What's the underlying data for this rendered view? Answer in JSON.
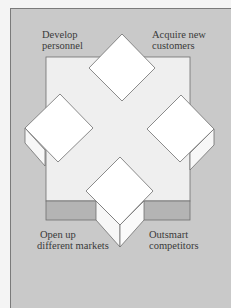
{
  "diagram": {
    "labels": {
      "top_left": [
        "Develop",
        "personnel"
      ],
      "top_right": [
        "Acquire new",
        "customers"
      ],
      "bottom_left": [
        "Open up",
        "different markets"
      ],
      "bottom_right": [
        "Outsmart",
        "competitors"
      ]
    },
    "colors": {
      "background": "#c9c9c9",
      "platform_top": "#efefef",
      "platform_front": "#b4b4b4",
      "block_face": "#ffffff",
      "outline": "#6e6e6e"
    }
  }
}
